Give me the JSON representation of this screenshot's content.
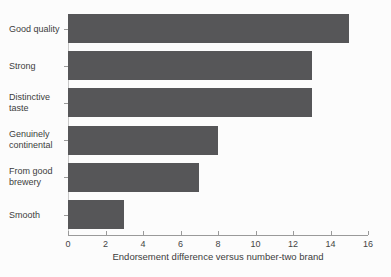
{
  "chart_data": {
    "type": "bar",
    "orientation": "horizontal",
    "title": "",
    "xlabel": "Endorsement difference versus number-two brand",
    "ylabel": "",
    "categories": [
      "Good quality",
      "Strong",
      "Distinctive taste",
      "Genuinely continental",
      "From good brewery",
      "Smooth"
    ],
    "category_lines": [
      [
        "Good quality"
      ],
      [
        "Strong"
      ],
      [
        "Distinctive",
        "taste"
      ],
      [
        "Genuinely",
        "continental"
      ],
      [
        "From good",
        "brewery"
      ],
      [
        "Smooth"
      ]
    ],
    "values": [
      15,
      13,
      13,
      8,
      7,
      3
    ],
    "xlim": [
      0,
      16
    ],
    "xticks": [
      0,
      2,
      4,
      6,
      8,
      10,
      12,
      14,
      16
    ],
    "grid": false,
    "legend": false,
    "colors": {
      "bar": "#565658",
      "axis": "#9a9a9a",
      "text": "#3c3c3c",
      "background": "#fcfcfc"
    }
  }
}
